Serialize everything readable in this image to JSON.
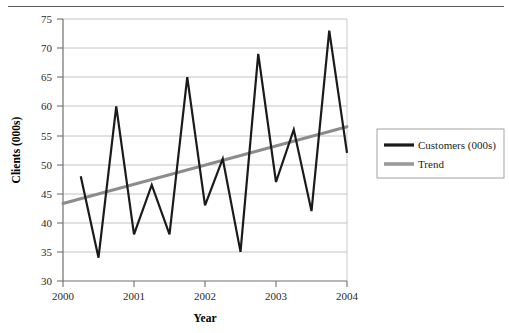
{
  "figure": {
    "has_top_rule": true
  },
  "chart_data": {
    "type": "line",
    "title": "",
    "xlabel": "Year",
    "ylabel": "Clients (000s)",
    "xlim": [
      2000,
      2004
    ],
    "ylim": [
      30,
      75
    ],
    "ytick_step": 5,
    "xtick_step": 1,
    "xticks": [
      "2000",
      "2001",
      "2002",
      "2003",
      "2004"
    ],
    "yticks": [
      "30",
      "35",
      "40",
      "45",
      "50",
      "55",
      "60",
      "65",
      "70",
      "75"
    ],
    "grid": "horizontal",
    "legend_position": "right",
    "x": [
      2000.25,
      2000.5,
      2000.75,
      2001,
      2001.25,
      2001.5,
      2001.75,
      2002,
      2002.25,
      2002.5,
      2002.75,
      2003,
      2003.25,
      2003.5,
      2003.75,
      2004
    ],
    "series": [
      {
        "name": "Customers (000s)",
        "color": "#1a1a1a",
        "width": 2.2,
        "values": [
          48,
          34,
          60,
          38,
          46.5,
          38,
          65,
          43,
          51,
          35,
          69,
          47,
          56,
          42,
          73,
          52
        ]
      },
      {
        "name": "Trend",
        "color": "#8c8c8c",
        "width": 3.0,
        "type": "linear-trend",
        "endpoints": [
          [
            2000,
            43.3
          ],
          [
            2004,
            56.5
          ]
        ]
      }
    ],
    "legend": [
      {
        "label": "Customers (000s)",
        "color": "#1a1a1a",
        "width": 3.2
      },
      {
        "label": "Trend",
        "color": "#9a9a9a",
        "width": 3.6
      }
    ]
  },
  "colors": {
    "grid": "#bdbdbd",
    "axis": "#7d7d7d",
    "plot_border": "#c0c0c0",
    "series_primary": "#1a1a1a",
    "series_trend": "#8c8c8c",
    "legend_border": "#9a9a9a",
    "top_rule": "#5a5a5a"
  }
}
